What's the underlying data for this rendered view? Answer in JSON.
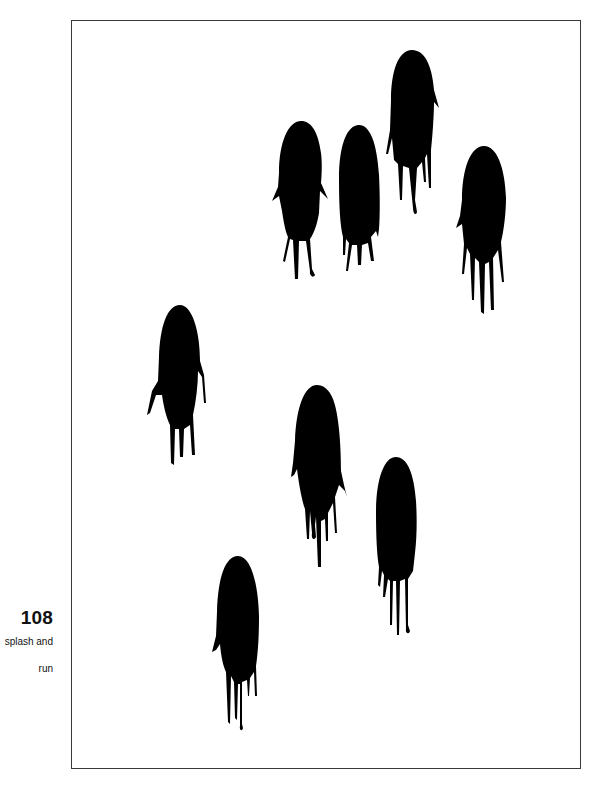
{
  "page": {
    "number": "108",
    "caption_lines": [
      "splash and",
      "run"
    ]
  },
  "artwork": {
    "subject": "ink splash drip figures",
    "color": "#000000",
    "figure_count": 8
  },
  "frame": {
    "border_color": "#3a3a3a"
  }
}
